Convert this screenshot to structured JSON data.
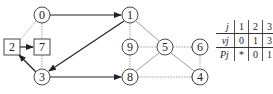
{
  "graph": {
    "nodes": [
      {
        "id": "0",
        "label": "0",
        "shape": "circle",
        "x": 42,
        "y": 15
      },
      {
        "id": "1",
        "label": "1",
        "shape": "circle",
        "x": 130,
        "y": 15
      },
      {
        "id": "2",
        "label": "2",
        "shape": "square",
        "x": 12,
        "y": 47
      },
      {
        "id": "7",
        "label": "7",
        "shape": "square",
        "x": 42,
        "y": 47
      },
      {
        "id": "9",
        "label": "9",
        "shape": "circle",
        "x": 130,
        "y": 47
      },
      {
        "id": "5",
        "label": "5",
        "shape": "circle",
        "x": 165,
        "y": 47
      },
      {
        "id": "6",
        "label": "6",
        "shape": "circle",
        "x": 200,
        "y": 47
      },
      {
        "id": "3",
        "label": "3",
        "shape": "circle",
        "x": 42,
        "y": 77
      },
      {
        "id": "8",
        "label": "8",
        "shape": "circle",
        "x": 130,
        "y": 77
      },
      {
        "id": "4",
        "label": "4",
        "shape": "circle",
        "x": 200,
        "y": 77
      }
    ],
    "directed_edges": [
      {
        "from": "0",
        "to": "1"
      },
      {
        "from": "1",
        "to": "3"
      },
      {
        "from": "3",
        "to": "8"
      },
      {
        "from": "2",
        "to": "7"
      },
      {
        "from": "3",
        "to": "2"
      }
    ],
    "undirected_edges": [
      {
        "from": "0",
        "to": "2"
      },
      {
        "from": "0",
        "to": "7"
      },
      {
        "from": "7",
        "to": "3"
      },
      {
        "from": "1",
        "to": "9"
      },
      {
        "from": "1",
        "to": "5"
      },
      {
        "from": "9",
        "to": "5"
      },
      {
        "from": "9",
        "to": "8"
      },
      {
        "from": "8",
        "to": "5"
      },
      {
        "from": "5",
        "to": "6"
      },
      {
        "from": "5",
        "to": "4"
      },
      {
        "from": "6",
        "to": "4"
      },
      {
        "from": "8",
        "to": "4"
      }
    ]
  },
  "table": {
    "rows": [
      {
        "header": "j",
        "cells": [
          "1",
          "2",
          "3",
          "6"
        ]
      },
      {
        "header": "vj",
        "cells": [
          "0",
          "1",
          "3",
          "8"
        ]
      },
      {
        "header": "Pj",
        "cells": [
          "*",
          "0",
          "1",
          "3"
        ]
      }
    ]
  }
}
